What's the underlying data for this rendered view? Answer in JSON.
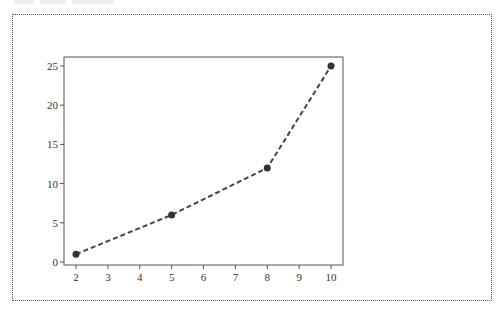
{
  "chart_data": {
    "type": "line",
    "title": "",
    "xlabel": "",
    "ylabel": "",
    "x": [
      2,
      5,
      8,
      10
    ],
    "series": [
      {
        "name": "",
        "values": [
          1,
          6,
          12,
          25
        ],
        "line_style": "dashed",
        "marker": "circle",
        "color": "#444444"
      }
    ],
    "xlim": [
      1.9,
      10.3
    ],
    "ylim": [
      -0.5,
      26.2
    ],
    "x_ticks": [
      "2",
      "3",
      "4",
      "5",
      "6",
      "7",
      "8",
      "9",
      "10"
    ],
    "y_ticks": [
      "0",
      "5",
      "10",
      "15",
      "20",
      "25"
    ],
    "grid": false,
    "legend": null
  },
  "frame": {
    "border_style": "dotted",
    "border_color": "#555555"
  }
}
